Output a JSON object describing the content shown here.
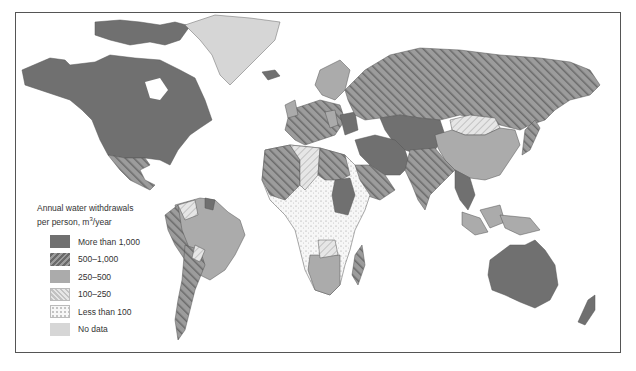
{
  "figure": {
    "type": "choropleth world map (grayscale)",
    "legend": {
      "title_line1": "Annual water withdrawals",
      "title_line2_prefix": "per person, m",
      "title_line2_sup": "3",
      "title_line2_suffix": "/year",
      "items": [
        {
          "label": "More than 1,000",
          "fill": "solid-dark",
          "color": "#6e6e6e"
        },
        {
          "label": "500–1,000",
          "fill": "diagonal-hatch-dark",
          "color": "#8a8a8a"
        },
        {
          "label": "250–500",
          "fill": "solid-medium",
          "color": "#ababab"
        },
        {
          "label": "100–250",
          "fill": "diagonal-hatch-light",
          "color": "#d4d4d4"
        },
        {
          "label": "Less than 100",
          "fill": "dotted",
          "color": "#f4f4f4"
        },
        {
          "label": "No data",
          "fill": "solid-light",
          "color": "#d6d6d6"
        }
      ]
    },
    "regions": [
      {
        "name": "Canada & Alaska & USA",
        "category": "More than 1,000"
      },
      {
        "name": "Greenland",
        "category": "No data"
      },
      {
        "name": "Mexico",
        "category": "500–1,000"
      },
      {
        "name": "Russia",
        "category": "500–1,000"
      },
      {
        "name": "Central Asia",
        "category": "More than 1,000"
      },
      {
        "name": "China",
        "category": "250–500"
      },
      {
        "name": "Mongolia",
        "category": "100–250"
      },
      {
        "name": "India",
        "category": "500–1,000"
      },
      {
        "name": "Australia",
        "category": "More than 1,000"
      },
      {
        "name": "Brazil",
        "category": "250–500"
      },
      {
        "name": "Argentina",
        "category": "500–1,000"
      },
      {
        "name": "Sub-Saharan Africa",
        "category": "Less than 100"
      },
      {
        "name": "Sudan",
        "category": "More than 1,000"
      },
      {
        "name": "Madagascar",
        "category": "500–1,000"
      },
      {
        "name": "Southern Africa",
        "category": "250–500"
      },
      {
        "name": "Western Europe",
        "category": "500–1,000"
      },
      {
        "name": "Scandinavia",
        "category": "250–500"
      },
      {
        "name": "Middle East",
        "category": "More than 1,000"
      },
      {
        "name": "North Africa (Algeria)",
        "category": "100–250"
      },
      {
        "name": "Libya / Egypt / Arabia",
        "category": "500–1,000"
      },
      {
        "name": "Indonesia",
        "category": "250–500"
      },
      {
        "name": "Japan",
        "category": "500–1,000"
      },
      {
        "name": "New Zealand",
        "category": "More than 1,000"
      }
    ],
    "caption": ""
  }
}
